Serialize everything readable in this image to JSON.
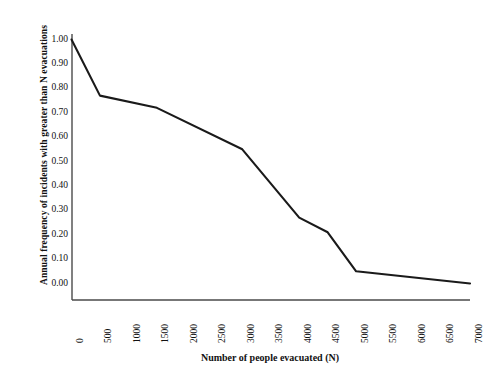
{
  "chart_data": {
    "type": "line",
    "title": "",
    "xlabel": "Number of people evacuated (N)",
    "ylabel": "Annual frequency of incidents with greater than N evacuations",
    "xlim": [
      0,
      7000
    ],
    "ylim": [
      0.0,
      1.0
    ],
    "grid": false,
    "legend": null,
    "xticks": [
      "0",
      "500",
      "1000",
      "1500",
      "2000",
      "2500",
      "3000",
      "3500",
      "4000",
      "4500",
      "5000",
      "5500",
      "6000",
      "6500",
      "7000"
    ],
    "yticks": [
      "0.00",
      "0.10",
      "0.20",
      "0.30",
      "0.40",
      "0.50",
      "0.60",
      "0.70",
      "0.80",
      "0.90",
      "1.00"
    ],
    "series": [
      {
        "name": "Annual frequency",
        "color": "#1a1a1a",
        "x": [
          0,
          500,
          1500,
          3000,
          4000,
          4500,
          5000,
          7000
        ],
        "values": [
          1.0,
          0.77,
          0.72,
          0.55,
          0.27,
          0.21,
          0.05,
          0.0
        ]
      }
    ]
  }
}
